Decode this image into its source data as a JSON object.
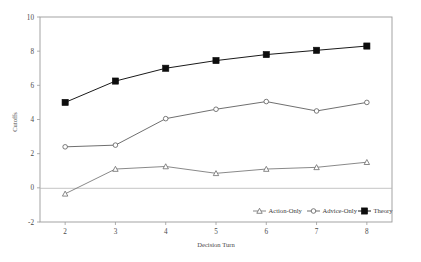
{
  "chart_data": {
    "type": "line",
    "title": "",
    "xlabel": "Decision Turn",
    "ylabel": "Cutoffs",
    "x": [
      2,
      3,
      4,
      5,
      6,
      7,
      8
    ],
    "xtick_labels": [
      "2",
      "3",
      "4",
      "5",
      "6",
      "7",
      "8"
    ],
    "ytick_labels": [
      "-2",
      "0",
      "2",
      "4",
      "6",
      "8",
      "10"
    ],
    "yticks": [
      -2,
      0,
      2,
      4,
      6,
      8,
      10
    ],
    "xlim": [
      1.5,
      8.5
    ],
    "ylim": [
      -2,
      10
    ],
    "grid": false,
    "zero_reference_line": 0,
    "legend_position": "bottom-right",
    "series": [
      {
        "name": "Action-Only",
        "marker": "open-triangle",
        "color": "#6b6b6b",
        "values": [
          -0.35,
          1.1,
          1.25,
          0.85,
          1.1,
          1.2,
          1.5
        ]
      },
      {
        "name": "Advice-Only",
        "marker": "open-circle",
        "color": "#555555",
        "values": [
          2.4,
          2.5,
          4.05,
          4.6,
          5.05,
          4.5,
          5.0
        ]
      },
      {
        "name": "Theory",
        "marker": "filled-square",
        "color": "#0d0d0d",
        "values": [
          5.0,
          6.25,
          7.0,
          7.45,
          7.8,
          8.05,
          8.3
        ]
      }
    ]
  },
  "legend": {
    "entries": [
      {
        "label": "Action-Only"
      },
      {
        "label": "Advice-Only"
      },
      {
        "label": "Theory"
      }
    ]
  }
}
